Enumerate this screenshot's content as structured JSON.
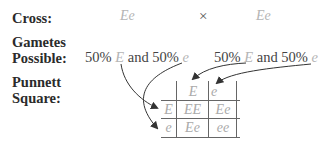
{
  "labels": {
    "cross": "Cross:",
    "gametes_line1": "Gametes",
    "gametes_line2": "Possible:",
    "punnett_line1": "Punnett",
    "punnett_line2": "Square:"
  },
  "cross": {
    "parent1": "Ee",
    "operator": "×",
    "parent2": "Ee"
  },
  "gametes": {
    "parent1": {
      "pct1": "50%",
      "allele1": "E",
      "joiner": "and",
      "pct2": "50%",
      "allele2": "e"
    },
    "parent2": {
      "pct1": "50%",
      "allele1": "E",
      "joiner": "and",
      "pct2": "50%",
      "allele2": "e"
    }
  },
  "punnett": {
    "col_headers": [
      "E",
      "e"
    ],
    "row_headers": [
      "E",
      "e"
    ],
    "cells": [
      [
        "EE",
        "Ee"
      ],
      [
        "Ee",
        "ee"
      ]
    ]
  },
  "colors": {
    "allele_text": "#b5b5b5",
    "grid_line": "#555555",
    "arrow": "#333333"
  }
}
